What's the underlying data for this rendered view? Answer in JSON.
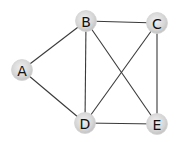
{
  "diagram": {
    "type": "undirected-graph",
    "colors": {
      "edge": "#3a3a3a",
      "node_fill_center": "#ececec",
      "node_fill_edge": "#c2c2c2",
      "label": "#111111",
      "background": "#ffffff"
    },
    "nodes": [
      {
        "id": "A",
        "label": "A",
        "x": 22,
        "y": 70
      },
      {
        "id": "B",
        "label": "B",
        "x": 86,
        "y": 21
      },
      {
        "id": "C",
        "label": "C",
        "x": 157,
        "y": 23
      },
      {
        "id": "D",
        "label": "D",
        "x": 85,
        "y": 123
      },
      {
        "id": "E",
        "label": "E",
        "x": 157,
        "y": 124
      }
    ],
    "edges": [
      {
        "from": "A",
        "to": "B"
      },
      {
        "from": "A",
        "to": "D"
      },
      {
        "from": "B",
        "to": "C"
      },
      {
        "from": "B",
        "to": "D"
      },
      {
        "from": "B",
        "to": "E"
      },
      {
        "from": "C",
        "to": "D"
      },
      {
        "from": "C",
        "to": "E"
      },
      {
        "from": "D",
        "to": "E"
      }
    ]
  }
}
